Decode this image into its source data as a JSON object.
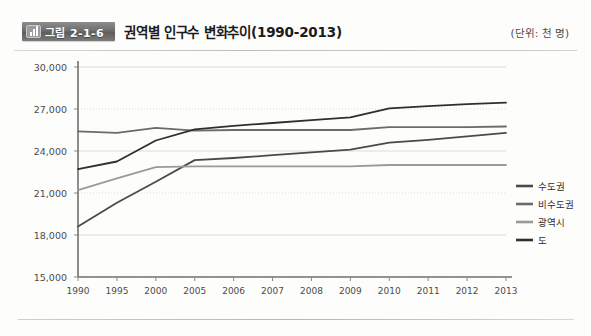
{
  "header": {
    "badge_label": "그림 2-1-6",
    "badge_icon": "bar-chart-icon",
    "title": "권역별 인구수 변화추이(1990-2013)",
    "unit_note": "(단위: 천 명)"
  },
  "colors": {
    "sudogwon": "#4a4a4a",
    "bisudogwon": "#6b6b6b",
    "gwangyeoksi": "#9a9a9a",
    "do": "#2f2f2f",
    "grid": "#dcdcdc",
    "axis": "#8a8a8a",
    "badge": "#6e6e6e"
  },
  "chart_data": {
    "type": "line",
    "title": "권역별 인구수 변화추이(1990-2013)",
    "unit": "천 명",
    "xlabel": "",
    "ylabel": "",
    "ylim": [
      15000,
      30000
    ],
    "yticks": [
      15000,
      18000,
      21000,
      24000,
      27000,
      30000
    ],
    "ytick_labels": [
      "15,000",
      "18,000",
      "21,000",
      "24,000",
      "27,000",
      "30,000"
    ],
    "categories": [
      "1990",
      "1995",
      "2000",
      "2005",
      "2006",
      "2007",
      "2008",
      "2009",
      "2010",
      "2011",
      "2012",
      "2013"
    ],
    "grid": true,
    "legend_position": "right",
    "series": [
      {
        "name": "수도권",
        "color": "#4a4a4a",
        "values": [
          18600,
          20300,
          21800,
          23350,
          23500,
          23700,
          23900,
          24100,
          24600,
          24800,
          25050,
          25300
        ]
      },
      {
        "name": "비수도권",
        "color": "#6b6b6b",
        "values": [
          25400,
          25300,
          25650,
          25450,
          25500,
          25500,
          25500,
          25500,
          25700,
          25700,
          25700,
          25750
        ]
      },
      {
        "name": "광역시",
        "color": "#9a9a9a",
        "values": [
          21200,
          22050,
          22850,
          22900,
          22900,
          22900,
          22900,
          22900,
          23000,
          23000,
          23000,
          23000
        ]
      },
      {
        "name": "도",
        "color": "#2f2f2f",
        "values": [
          22700,
          23250,
          24750,
          25550,
          25800,
          26000,
          26200,
          26400,
          27050,
          27200,
          27350,
          27450
        ]
      }
    ]
  },
  "legend": {
    "items": [
      {
        "label": "수도권",
        "color": "#4a4a4a"
      },
      {
        "label": "비수도권",
        "color": "#6b6b6b"
      },
      {
        "label": "광역시",
        "color": "#9a9a9a"
      },
      {
        "label": "도",
        "color": "#2f2f2f"
      }
    ]
  }
}
